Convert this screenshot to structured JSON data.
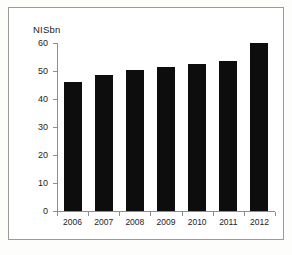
{
  "figure": {
    "border_color": "#9a9a9a",
    "background": "#ffffff",
    "caption_fragment": ""
  },
  "chart_data": {
    "type": "bar",
    "title": "",
    "subtitle": "",
    "xlabel": "",
    "ylabel": "NISbn",
    "categories": [
      "2006",
      "2007",
      "2008",
      "2009",
      "2010",
      "2011",
      "2012"
    ],
    "values": [
      46,
      48.5,
      50.5,
      51.5,
      52.5,
      53.5,
      60
    ],
    "series": [
      {
        "name": "NISbn",
        "values": [
          46,
          48.5,
          50.5,
          51.5,
          52.5,
          53.5,
          60
        ]
      }
    ],
    "ylim": [
      0,
      60
    ],
    "yticks": [
      0,
      10,
      20,
      30,
      40,
      50,
      60
    ],
    "ytick_labels": [
      "0",
      "10",
      "20",
      "30",
      "40",
      "50",
      "60"
    ],
    "grid": false,
    "legend": null,
    "bar_color": "#0d0d0d",
    "axis_color": "#8d8d8d",
    "text_color": "#1c1c1c"
  }
}
